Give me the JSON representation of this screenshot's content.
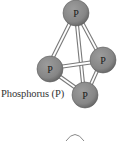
{
  "diagram": {
    "label": "Phosphorus (P)",
    "atom_symbol": "P",
    "atoms": [
      {
        "id": "top",
        "symbol": "P",
        "cx": 76,
        "cy": 13
      },
      {
        "id": "left",
        "symbol": "P",
        "cx": 50,
        "cy": 69
      },
      {
        "id": "right",
        "symbol": "P",
        "cx": 103,
        "cy": 60
      },
      {
        "id": "bottom",
        "symbol": "P",
        "cx": 85,
        "cy": 95
      }
    ],
    "bonds": [
      [
        "top",
        "left"
      ],
      [
        "top",
        "right"
      ],
      [
        "top",
        "bottom"
      ],
      [
        "left",
        "right"
      ],
      [
        "left",
        "bottom"
      ],
      [
        "right",
        "bottom"
      ]
    ],
    "colors": {
      "atom_fill": "#8a8a8a",
      "atom_edge": "#5e5e5e",
      "bond_outline": "#7a7a7a",
      "bond_core": "#ffffff",
      "label": "#333333"
    }
  }
}
